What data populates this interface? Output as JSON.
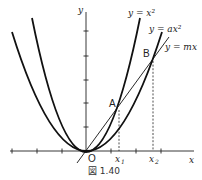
{
  "figure": {
    "caption": "図 1.40",
    "axes": {
      "x_label": "x",
      "y_label": "y",
      "origin_label": "O"
    },
    "curves": [
      {
        "name": "steep-parabola",
        "label": "y = x²"
      },
      {
        "name": "wide-parabola",
        "label": "y = ax²"
      },
      {
        "name": "line",
        "label": "y = mx"
      }
    ],
    "points": [
      {
        "name": "A",
        "label": "A"
      },
      {
        "name": "B",
        "label": "B"
      }
    ],
    "x_markers": [
      {
        "name": "x1",
        "label": "x",
        "sub": "1"
      },
      {
        "name": "x2",
        "label": "x",
        "sub": "2"
      }
    ]
  }
}
